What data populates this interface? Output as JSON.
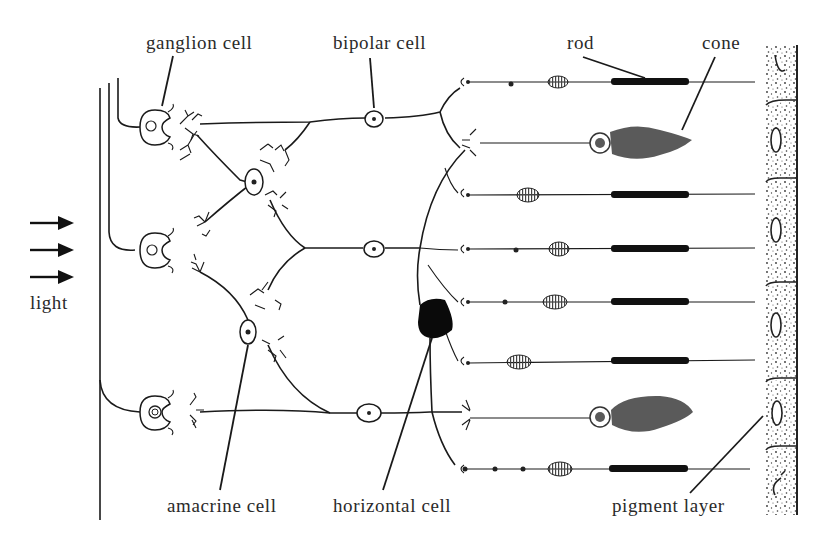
{
  "figure": {
    "labels": {
      "ganglion_cell": "ganglion cell",
      "bipolar_cell": "bipolar cell",
      "rod": "rod",
      "cone": "cone",
      "light": "light",
      "amacrine_cell": "amacrine cell",
      "horizontal_cell": "horizontal cell",
      "pigment_layer": "pigment layer"
    },
    "light_arrows": 3,
    "photoreceptor_rows": [
      {
        "y": 82,
        "type": "rod"
      },
      {
        "y": 140,
        "type": "cone"
      },
      {
        "y": 193,
        "type": "rod"
      },
      {
        "y": 248,
        "type": "rod"
      },
      {
        "y": 302,
        "type": "rod"
      },
      {
        "y": 361,
        "type": "rod"
      },
      {
        "y": 415,
        "type": "cone"
      },
      {
        "y": 469,
        "type": "rod"
      }
    ],
    "ganglion_cells": 3,
    "bipolar_cells": 3,
    "amacrine_cells": 2,
    "horizontal_cells": 1,
    "pigment_cells": 6,
    "colors": {
      "line": "#1a1a1a",
      "cone_fill": "#5a5a5a",
      "rod_outer_segment": "#111111",
      "background": "#ffffff"
    }
  }
}
